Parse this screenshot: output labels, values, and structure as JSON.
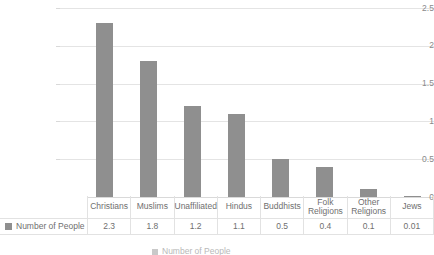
{
  "chart_data": {
    "type": "bar",
    "title": "",
    "subtitle": "",
    "xlabel": "",
    "ylabel": "",
    "ylim": [
      0,
      2.5
    ],
    "yticks": [
      "0",
      "0.5",
      "1",
      "1.5",
      "2",
      "2.5"
    ],
    "ytick_values": [
      0,
      0.5,
      1,
      1.5,
      2,
      2.5
    ],
    "grid": true,
    "legend_position": "bottom",
    "series_name": "Number of People",
    "bar_color": "#8f8f8f",
    "categories": [
      "Christians",
      "Muslims",
      "Unaffiliated",
      "Hindus",
      "Buddhists",
      "Folk Religions",
      "Other Religions",
      "Jews"
    ],
    "values": [
      2.3,
      1.8,
      1.2,
      1.1,
      0.5,
      0.4,
      0.1,
      0.01
    ],
    "value_labels": [
      "2.3",
      "1.8",
      "1.2",
      "1.1",
      "0.5",
      "0.4",
      "0.1",
      "0.01"
    ],
    "series": [
      {
        "name": "Number of People",
        "values": [
          2.3,
          1.8,
          1.2,
          1.1,
          0.5,
          0.4,
          0.1,
          0.01
        ]
      }
    ]
  },
  "legend": {
    "swatch_color": "#8f8f8f",
    "row_label": "Number of People",
    "bottom_clipped_label": "Number of People"
  },
  "colors": {
    "bar": "#8f8f8f",
    "gridline": "#e4e4e4",
    "table_border": "#e2e2e2",
    "text": "#6f6f6f"
  }
}
